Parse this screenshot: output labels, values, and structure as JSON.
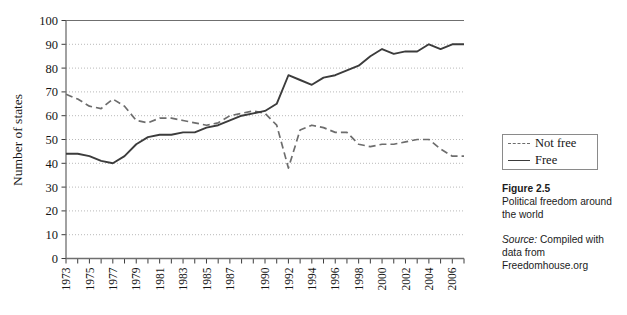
{
  "chart_data": {
    "type": "line",
    "title": "",
    "xlabel": "",
    "ylabel": "Number of states",
    "ylim": [
      0,
      100
    ],
    "ytick_step": 10,
    "yticks": [
      "0",
      "10",
      "20",
      "30",
      "40",
      "50",
      "60",
      "70",
      "80",
      "90",
      "100"
    ],
    "grid": "horizontal dotted gridlines, no vertical gridlines",
    "legend_position": "right, outside plot, boxed",
    "x": [
      1973,
      1974,
      1975,
      1976,
      1977,
      1978,
      1979,
      1980,
      1981,
      1982,
      1983,
      1984,
      1985,
      1986,
      1987,
      1988,
      1989,
      1990,
      1991,
      1992,
      1993,
      1994,
      1995,
      1996,
      1997,
      1998,
      1999,
      2000,
      2001,
      2002,
      2003,
      2004,
      2005,
      2006,
      2007
    ],
    "xtick_labels": [
      "1973",
      "",
      "1975",
      "",
      "1977",
      "",
      "1979",
      "",
      "1981",
      "",
      "1983",
      "",
      "1985",
      "",
      "1987",
      "",
      "",
      "1990",
      "",
      "1992",
      "",
      "1994",
      "",
      "1996",
      "",
      "1998",
      "",
      "2000",
      "",
      "2002",
      "",
      "2004",
      "",
      "2006",
      ""
    ],
    "series": [
      {
        "name": "Not free",
        "style": "dashed",
        "color": "#6d6d6d",
        "values": [
          69,
          67,
          64,
          63,
          67,
          64,
          58,
          57,
          59,
          59,
          58,
          57,
          56,
          57,
          60,
          61,
          62,
          61,
          56,
          38,
          54,
          56,
          55,
          53,
          53,
          48,
          47,
          48,
          48,
          49,
          50,
          50,
          46,
          43,
          43
        ]
      },
      {
        "name": "Free",
        "style": "solid",
        "color": "#3c3c3c",
        "values": [
          44,
          44,
          43,
          41,
          40,
          43,
          48,
          51,
          52,
          52,
          53,
          53,
          55,
          56,
          58,
          60,
          61,
          62,
          65,
          77,
          75,
          73,
          76,
          77,
          79,
          81,
          85,
          88,
          86,
          87,
          87,
          90,
          88,
          90,
          90
        ]
      }
    ]
  },
  "legend": {
    "entries": [
      {
        "label": "Not free",
        "style": "dashed"
      },
      {
        "label": "Free",
        "style": "solid"
      }
    ]
  },
  "caption": {
    "figure_number": "Figure 2.5",
    "description": "Political freedom around the world",
    "source_label": "Source:",
    "source_text": "Compiled with data from Freedomhouse.org"
  }
}
